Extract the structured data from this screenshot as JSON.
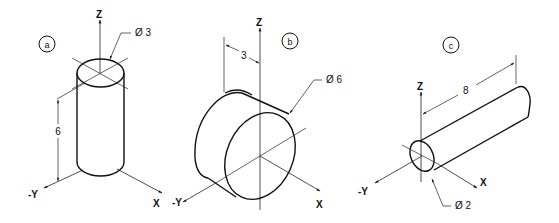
{
  "figure": {
    "background": "#ffffff",
    "line_color": "#111111",
    "views": [
      {
        "id": "a",
        "label": "a",
        "shape": "cylinder",
        "orientation": "vertical along Z",
        "axes": {
          "z": "Z",
          "neg_y": "-Y",
          "x": "X"
        },
        "dimensions": {
          "diameter": "Ø 3",
          "height": "6"
        }
      },
      {
        "id": "b",
        "label": "b",
        "shape": "cylinder (disc)",
        "orientation": "along Y",
        "axes": {
          "z": "Z",
          "neg_y": "-Y",
          "x": "X"
        },
        "dimensions": {
          "diameter": "Ø 6",
          "length": "3"
        }
      },
      {
        "id": "c",
        "label": "c",
        "shape": "cylinder (rod)",
        "orientation": "along X",
        "axes": {
          "z": "Z",
          "neg_y": "-Y",
          "x": "X"
        },
        "dimensions": {
          "diameter": "Ø 2",
          "length": "8"
        }
      }
    ]
  }
}
